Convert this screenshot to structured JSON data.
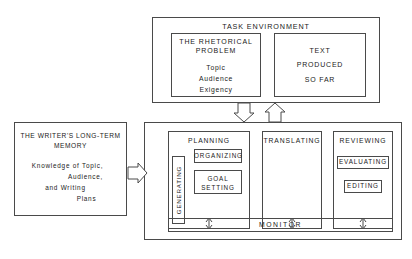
{
  "diagram": {
    "colors": {
      "background": "#ffffff",
      "stroke": "#4a4a4a",
      "text": "#1a1a1a"
    },
    "task_environment": {
      "title": "TASK ENVIRONMENT",
      "rhetorical_problem": {
        "title_line1": "THE RHETORICAL",
        "title_line2": "PROBLEM",
        "items": [
          "Topic",
          "Audience",
          "Exigency"
        ]
      },
      "text_produced": {
        "lines": [
          "TEXT",
          "PRODUCED",
          "SO FAR"
        ]
      }
    },
    "long_term_memory": {
      "title_line1": "THE WRITER'S LONG-TERM",
      "title_line2": "MEMORY",
      "body_lines": [
        "Knowledge of Topic,",
        "Audience,",
        "and Writing",
        "Plans"
      ]
    },
    "writing_process": {
      "planning": {
        "title": "PLANNING",
        "generating": "GENERATING",
        "organizing": "ORGANIZING",
        "goal_setting_line1": "GOAL",
        "goal_setting_line2": "SETTING"
      },
      "translating": {
        "title": "TRANSLATING"
      },
      "reviewing": {
        "title": "REVIEWING",
        "evaluating": "EVALUATING",
        "editing": "EDITING"
      },
      "monitor": "MONITOR"
    }
  }
}
